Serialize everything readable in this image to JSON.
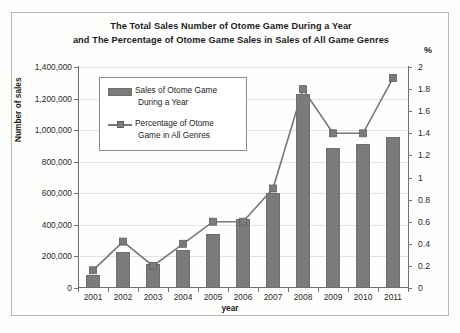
{
  "chart_data": {
    "type": "bar",
    "title": "The Total Sales Number of Otome Game During  a Year\nand The Percentage of Otome Game Sales in Sales of All Game Genres",
    "title_line1": "The Total Sales Number of Otome Game During  a Year",
    "title_line2": "and The Percentage of Otome Game Sales in Sales of All Game Genres",
    "xlabel": "year",
    "ylabel": "Number of sales",
    "y2label": "%",
    "categories": [
      "2001",
      "2002",
      "2003",
      "2004",
      "2005",
      "2006",
      "2007",
      "2008",
      "2009",
      "2010",
      "2011"
    ],
    "ylim": [
      0,
      1400000
    ],
    "y2lim": [
      0,
      2
    ],
    "yticks": [
      "0",
      "200,000",
      "400,000",
      "600,000",
      "800,000",
      "1,000,000",
      "1,200,000",
      "1,400,000"
    ],
    "ytick_values": [
      0,
      200000,
      400000,
      600000,
      800000,
      1000000,
      1200000,
      1400000
    ],
    "y2ticks": [
      "0",
      "0.2",
      "0.4",
      "0.6",
      "0.8",
      "1",
      "1.2",
      "1.4",
      "1.6",
      "1.8",
      "2"
    ],
    "y2tick_values": [
      0,
      0.2,
      0.4,
      0.6,
      0.8,
      1,
      1.2,
      1.4,
      1.6,
      1.8,
      2
    ],
    "grid": true,
    "legend_position": "upper-left-inside",
    "series": [
      {
        "name": "Sales of Otome Game During a Year",
        "legend_line1": "Sales of Otome Game",
        "legend_line2": "During a Year",
        "type": "bar",
        "axis": "left",
        "color": "#7b7b7b",
        "values": [
          80000,
          230000,
          150000,
          240000,
          340000,
          440000,
          600000,
          1230000,
          890000,
          910000,
          960000
        ]
      },
      {
        "name": "Percentage of Otome Game in All Genres",
        "legend_line1": "Percentage of Otome",
        "legend_line2": "Game in All Genres",
        "type": "line",
        "axis": "right",
        "color": "#777777",
        "values": [
          0.16,
          0.42,
          0.2,
          0.4,
          0.6,
          0.6,
          0.9,
          1.8,
          1.4,
          1.4,
          1.9
        ]
      }
    ]
  }
}
